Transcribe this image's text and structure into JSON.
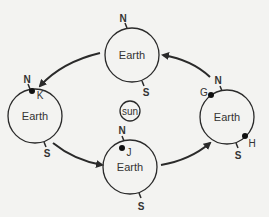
{
  "diagram": {
    "sun": {
      "label": "sun"
    },
    "earths": [
      {
        "position": "top",
        "label": "Earth",
        "north": "N",
        "south": "S",
        "points": []
      },
      {
        "position": "left",
        "label": "Earth",
        "north": "N",
        "south": "S",
        "points": [
          "K"
        ]
      },
      {
        "position": "bottom",
        "label": "Earth",
        "north": "N",
        "south": "S",
        "points": [
          "J"
        ]
      },
      {
        "position": "right",
        "label": "Earth",
        "north": "N",
        "south": "S",
        "points": [
          "G",
          "H"
        ]
      }
    ],
    "orbit_direction": "counterclockwise",
    "colors": {
      "line": "#2a2a2a",
      "background": "#f3f3f1"
    }
  }
}
